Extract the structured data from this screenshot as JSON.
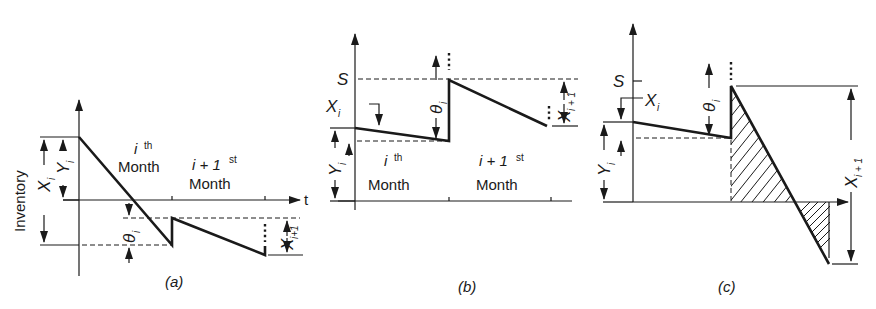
{
  "figure": {
    "panels": [
      {
        "id": "a",
        "caption": "(a)",
        "y_axis_label": "Inventory",
        "x_axis_label": "t",
        "labels": {
          "X": "X",
          "X_sub": "i",
          "Y": "Y",
          "Y_sub": "i",
          "theta": "θ",
          "theta_sub": "i",
          "Xnext": "X",
          "Xnext_sub": "i+1",
          "month1_top": "i",
          "month1_sup": "th",
          "month1_word": "Month",
          "month2_top": "i + 1",
          "month2_sup": "st",
          "month2_word": "Month"
        }
      },
      {
        "id": "b",
        "caption": "(b)",
        "labels": {
          "S": "S",
          "X": "X",
          "X_sub": "i",
          "Y": "Y",
          "Y_sub": "i",
          "theta": "θ",
          "theta_sub": "i",
          "Xnext": "X",
          "Xnext_sub": "i + 1",
          "month1_top": "i",
          "month1_sup": "th",
          "month1_word": "Month",
          "month2_top": "i + 1",
          "month2_sup": "st",
          "month2_word": "Month"
        }
      },
      {
        "id": "c",
        "caption": "(c)",
        "labels": {
          "S": "S",
          "X": "X",
          "X_sub": "i",
          "Y": "Y",
          "Y_sub": "i",
          "theta": "θ",
          "theta_sub": "i",
          "Xnext": "X",
          "Xnext_sub": "i + 1"
        }
      }
    ],
    "ellipsis": "⋮"
  }
}
